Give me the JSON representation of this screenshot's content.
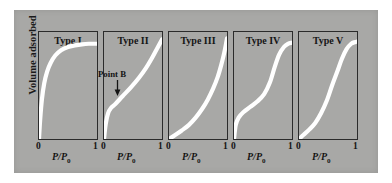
{
  "figure": {
    "background_color": "#a8a8a6",
    "curve_color": "#ffffff",
    "axis_color": "#2b2b2b",
    "ylabel": "Volume adsorbed",
    "xlabel_text": "P/P",
    "xlabel_subscript": "0",
    "tick_min": "0",
    "tick_max": "1",
    "annotation": {
      "label": "Point B",
      "icon": "down-arrow-icon"
    }
  },
  "chart_data": {
    "type": "line",
    "xlabel": "P/P0",
    "ylabel": "Volume adsorbed",
    "xlim": [
      0,
      1
    ],
    "ylim": [
      0,
      1
    ],
    "grid": false,
    "legend": "none",
    "annotations": [
      {
        "text": "Point B",
        "panel": "Type II",
        "x": 0.14,
        "y": 0.3,
        "arrow": "down"
      }
    ],
    "panels": [
      {
        "label": "Type I",
        "description": "Langmuir-type: steep initial uptake then plateau (microporous)",
        "x": [
          0.0,
          0.02,
          0.05,
          0.09,
          0.14,
          0.2,
          0.28,
          0.38,
          0.5,
          0.62,
          0.74,
          0.86,
          1.0
        ],
        "y": [
          0.0,
          0.18,
          0.37,
          0.52,
          0.63,
          0.71,
          0.78,
          0.83,
          0.86,
          0.875,
          0.885,
          0.89,
          0.89
        ]
      },
      {
        "label": "Type II",
        "description": "Sigmoidal with Point B knee then unrestricted multilayer rise (non-porous/macroporous)",
        "x": [
          0.0,
          0.03,
          0.07,
          0.12,
          0.2,
          0.32,
          0.46,
          0.6,
          0.72,
          0.82,
          0.9,
          0.96,
          1.0
        ],
        "y": [
          0.0,
          0.14,
          0.24,
          0.29,
          0.33,
          0.4,
          0.48,
          0.57,
          0.66,
          0.75,
          0.83,
          0.89,
          0.93
        ]
      },
      {
        "label": "Type III",
        "description": "Convex to P/P0 axis throughout; weak adsorbent-adsorbate interaction",
        "x": [
          0.0,
          0.1,
          0.22,
          0.34,
          0.46,
          0.57,
          0.67,
          0.76,
          0.84,
          0.9,
          0.95,
          0.98,
          1.0
        ],
        "y": [
          0.0,
          0.035,
          0.08,
          0.13,
          0.2,
          0.28,
          0.37,
          0.47,
          0.58,
          0.69,
          0.8,
          0.88,
          0.94
        ]
      },
      {
        "label": "Type IV",
        "description": "Point B knee, plateau, capillary condensation step, final saturation plateau (mesoporous)",
        "x": [
          0.0,
          0.03,
          0.08,
          0.16,
          0.28,
          0.4,
          0.52,
          0.62,
          0.7,
          0.78,
          0.86,
          0.93,
          1.0
        ],
        "y": [
          0.0,
          0.13,
          0.2,
          0.25,
          0.3,
          0.35,
          0.42,
          0.53,
          0.67,
          0.79,
          0.86,
          0.89,
          0.9
        ]
      },
      {
        "label": "Type V",
        "description": "Type III-like at low P/P0 with condensation step and saturation plateau",
        "x": [
          0.0,
          0.08,
          0.18,
          0.28,
          0.38,
          0.48,
          0.57,
          0.66,
          0.74,
          0.82,
          0.9,
          0.96,
          1.0
        ],
        "y": [
          0.0,
          0.04,
          0.09,
          0.15,
          0.24,
          0.36,
          0.5,
          0.63,
          0.75,
          0.84,
          0.89,
          0.905,
          0.91
        ]
      }
    ]
  }
}
